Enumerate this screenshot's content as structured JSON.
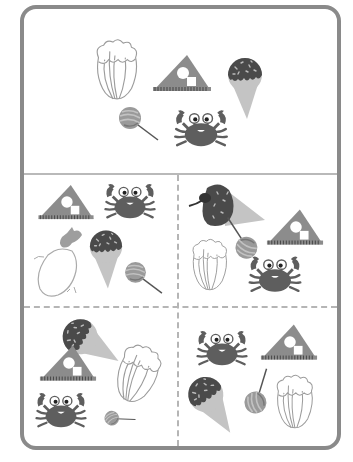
{
  "worksheet": {
    "type": "find-the-matching-set puzzle",
    "colors": {
      "border": "#8a8a8a",
      "divider": "#b5b5b5",
      "crab": "#5e5e5e",
      "ruler": "#8c8c8c",
      "icecream_top": "#4a4a4a",
      "icecream_cone": "#c4c4c4",
      "lollipop": "#9a9a9a",
      "outline_veg": "#a8a8a8"
    },
    "reference_panel": {
      "items": [
        "chinese-cabbage",
        "triangle-ruler",
        "ice-cream-cone",
        "lollipop",
        "crab"
      ]
    },
    "option_panels": [
      {
        "position": "top-left",
        "items": [
          "triangle-ruler",
          "crab",
          "eggplant",
          "ice-cream-cone",
          "lollipop"
        ]
      },
      {
        "position": "top-right",
        "items": [
          "ice-cream-cone-with-bird",
          "triangle-ruler",
          "lollipop",
          "chinese-cabbage",
          "crab"
        ]
      },
      {
        "position": "bottom-left",
        "items": [
          "ice-cream-cone",
          "triangle-ruler",
          "chinese-cabbage",
          "crab",
          "lollipop"
        ]
      },
      {
        "position": "bottom-right",
        "items": [
          "crab",
          "triangle-ruler",
          "ice-cream-cone",
          "lollipop",
          "chinese-cabbage"
        ]
      }
    ]
  }
}
